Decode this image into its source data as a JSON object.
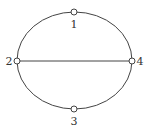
{
  "diagram": {
    "type": "graph",
    "stroke_color": "#444444",
    "nodes": [
      {
        "id": "1",
        "label": "1",
        "x": 74,
        "y": 12,
        "label_x": 74,
        "label_y": 28
      },
      {
        "id": "2",
        "label": "2",
        "x": 17,
        "y": 61,
        "label_x": 9,
        "label_y": 65
      },
      {
        "id": "3",
        "label": "3",
        "x": 74,
        "y": 109,
        "label_x": 74,
        "label_y": 125
      },
      {
        "id": "4",
        "label": "4",
        "x": 132,
        "y": 61,
        "label_x": 140,
        "label_y": 65
      }
    ],
    "edges": [
      {
        "from": "1",
        "to": "2",
        "shape": "arc"
      },
      {
        "from": "1",
        "to": "4",
        "shape": "arc"
      },
      {
        "from": "2",
        "to": "3",
        "shape": "arc"
      },
      {
        "from": "4",
        "to": "3",
        "shape": "arc"
      },
      {
        "from": "2",
        "to": "4",
        "shape": "line"
      }
    ]
  }
}
